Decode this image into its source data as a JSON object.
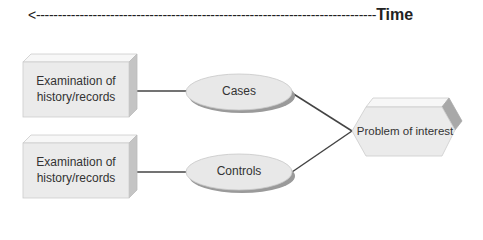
{
  "timeline": {
    "arrow": "<------------------------------------------------------------------------------",
    "label": "Time"
  },
  "nodes": {
    "record_top": {
      "label_line1": "Examination of",
      "label_line2": "history/records"
    },
    "record_bottom": {
      "label_line1": "Examination of",
      "label_line2": "history/records"
    },
    "cases": {
      "label": "Cases"
    },
    "controls": {
      "label": "Controls"
    },
    "problem": {
      "label": "Problem of interest"
    }
  },
  "colors": {
    "face": "#ebebeb",
    "top_face": "#f7f7f7",
    "side_face": "#c4c4c4",
    "shadow": "#9a9a9a",
    "line": "#444444",
    "text": "#333333"
  }
}
